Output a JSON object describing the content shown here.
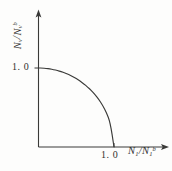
{
  "figure": {
    "type": "interaction-diagram",
    "background_color": "#fdfdfc",
    "ink_color": "#30302e"
  },
  "axes": {
    "x": {
      "title_main": "N",
      "title_sub": "1",
      "title_slash": "/",
      "title_main2": "N",
      "title_sub2": "1",
      "title_sup2": "b",
      "tick_label": "1. 0",
      "arrow": "arrow-right"
    },
    "y": {
      "title_main": "N",
      "title_sub": "v",
      "title_slash": "/",
      "title_main2": "N",
      "title_sub2": "v",
      "title_sup2": "b",
      "tick_label": "1. 0",
      "arrow": "arrow-up"
    }
  },
  "chart_data": {
    "type": "line",
    "title": "",
    "subtitle": "",
    "xlabel": "N1/N1b",
    "ylabel": "Nv/Nvb",
    "xlim": [
      0,
      1.45
    ],
    "ylim": [
      0,
      1.55
    ],
    "xticks": [
      1.0
    ],
    "xticklabels": [
      "1. 0"
    ],
    "yticks": [
      1.0
    ],
    "yticklabels": [
      "1. 0"
    ],
    "grid": false,
    "legend": null,
    "series": [
      {
        "name": "interaction curve",
        "description": "quarter circle of unit radius from (0,1) to (1,0)",
        "equation": "x^2 + y^2 = 1",
        "x": [
          0.0,
          0.05,
          0.1,
          0.15,
          0.2,
          0.25,
          0.3,
          0.35,
          0.4,
          0.45,
          0.5,
          0.55,
          0.6,
          0.65,
          0.7,
          0.75,
          0.8,
          0.85,
          0.9,
          0.95,
          1.0
        ],
        "y": [
          1.0,
          0.999,
          0.995,
          0.989,
          0.98,
          0.968,
          0.954,
          0.937,
          0.917,
          0.893,
          0.866,
          0.835,
          0.8,
          0.76,
          0.714,
          0.661,
          0.6,
          0.527,
          0.436,
          0.312,
          0.0
        ],
        "color": "#3a3a38",
        "linewidth": 1
      }
    ]
  }
}
